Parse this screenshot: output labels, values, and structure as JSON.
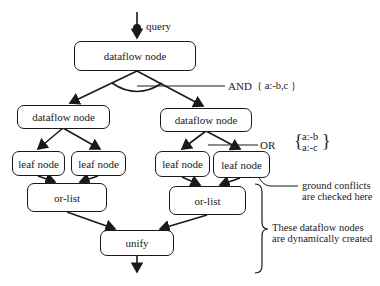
{
  "diagram": {
    "query_label": "query",
    "top_node": "dataflow node",
    "and_label": "AND",
    "and_clause": "{ a:-b,c }",
    "left_dataflow": "dataflow node",
    "right_dataflow": "dataflow node",
    "or_label": "OR",
    "or_clause_1": "a:-b",
    "or_clause_2": "a:-c",
    "left_leaf_1": "leaf node",
    "left_leaf_2": "leaf node",
    "right_leaf_1": "leaf node",
    "right_leaf_2": "leaf node",
    "left_orlist": "or-list",
    "right_orlist": "or-list",
    "unify": "unify",
    "ground_note_1": "ground conflicts",
    "ground_note_2": "are checked here",
    "dynamic_note_1": "These dataflow nodes",
    "dynamic_note_2": "are dynamically created"
  }
}
